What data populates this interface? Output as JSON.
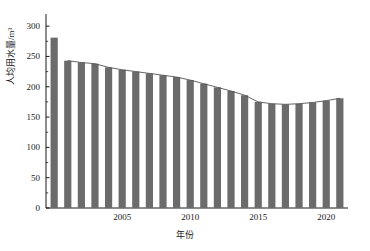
{
  "chart_data": {
    "type": "bar",
    "title": "",
    "subtitle": "",
    "xlabel": "年份",
    "ylabel": "人均用水量/m³",
    "xlim": [
      1999.4,
      2021.6
    ],
    "ylim": [
      0,
      320
    ],
    "grid": false,
    "legend": "none",
    "y_ticks": [
      0,
      50,
      100,
      150,
      200,
      250,
      300
    ],
    "x_ticks": [
      2005,
      2010,
      2015,
      2020
    ],
    "bar_color": "#6b6b6b",
    "line_color": "#555555",
    "axis_color": "#000000",
    "categories": [
      2000,
      2001,
      2002,
      2003,
      2004,
      2005,
      2006,
      2007,
      2008,
      2009,
      2010,
      2011,
      2012,
      2013,
      2014,
      2015,
      2016,
      2017,
      2018,
      2019,
      2020,
      2021
    ],
    "values": [
      281,
      243,
      240,
      238,
      232,
      228,
      225,
      222,
      219,
      216,
      211,
      205,
      199,
      193,
      186,
      175,
      172,
      171,
      172,
      174,
      177,
      181
    ],
    "series": [
      {
        "name": "人均用水量",
        "type": "bar",
        "values": [
          281,
          243,
          240,
          238,
          232,
          228,
          225,
          222,
          219,
          216,
          211,
          205,
          199,
          193,
          186,
          175,
          172,
          171,
          172,
          174,
          177,
          181
        ]
      },
      {
        "name": "趋势线",
        "type": "line",
        "values": [
          281,
          243,
          240,
          238,
          232,
          228,
          225,
          222,
          219,
          216,
          211,
          205,
          199,
          193,
          186,
          175,
          172,
          171,
          172,
          174,
          177,
          181
        ]
      }
    ],
    "annotations": []
  }
}
